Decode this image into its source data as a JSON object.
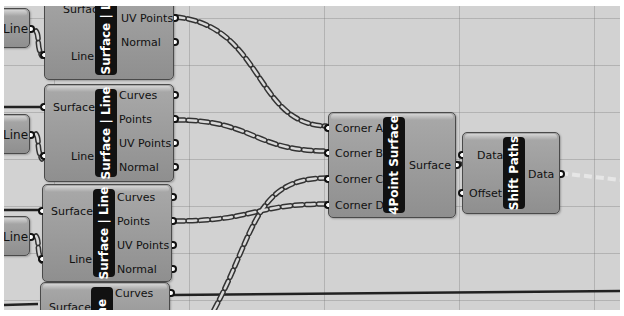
{
  "canvas": {
    "background": "#d2d2d2",
    "node_color": "#9e9e9e",
    "label_bar_color": "#111111"
  },
  "nodes": {
    "sl1": {
      "title": "Surface | Line",
      "inputs": [
        "Surface",
        "Line"
      ],
      "outputs": [
        "Points",
        "UV Points",
        "Normal"
      ]
    },
    "sl2": {
      "title": "Surface | Line",
      "inputs": [
        "Surface",
        "Line"
      ],
      "outputs": [
        "Curves",
        "Points",
        "UV Points",
        "Normal"
      ]
    },
    "sl3": {
      "title": "Surface | Line",
      "inputs": [
        "Surface",
        "Line"
      ],
      "outputs": [
        "Curves",
        "Points",
        "UV Points",
        "Normal"
      ]
    },
    "sl4": {
      "title": "Line",
      "inputs": [
        "Surface"
      ],
      "outputs": [
        "Curves"
      ]
    },
    "line1": {
      "title": "Line"
    },
    "line2": {
      "title": "Line"
    },
    "line3": {
      "title": "Line"
    },
    "fourpoint": {
      "title": "4Point Surface",
      "inputs": [
        "Corner A",
        "Corner B",
        "Corner C",
        "Corner D"
      ],
      "outputs": [
        "Surface"
      ]
    },
    "shift": {
      "title": "Shift Paths",
      "inputs": [
        "Data",
        "Offset"
      ],
      "outputs": [
        "Data"
      ]
    }
  }
}
